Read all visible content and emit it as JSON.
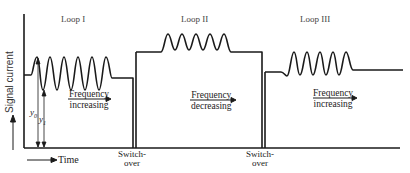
{
  "diagram": {
    "y_axis_label": "Signal current",
    "x_axis_label": "Time",
    "loops": [
      {
        "label": "Loop I",
        "annotation_line1": "Frequency",
        "annotation_line2": "increasing"
      },
      {
        "label": "Loop II",
        "annotation_line1": "Frequency",
        "annotation_line2": "decreasing"
      },
      {
        "label": "Loop III",
        "annotation_line1": "Frequency",
        "annotation_line2": "increasing"
      }
    ],
    "switchovers": [
      {
        "line1": "Switch-",
        "line2": "over"
      },
      {
        "line1": "Switch-",
        "line2": "over"
      }
    ],
    "markers": {
      "y0": "y",
      "y0_sub": "0",
      "y1": "y",
      "y1_sub": "1"
    },
    "colors": {
      "line": "#1a1a1a",
      "background": "#ffffff"
    }
  }
}
